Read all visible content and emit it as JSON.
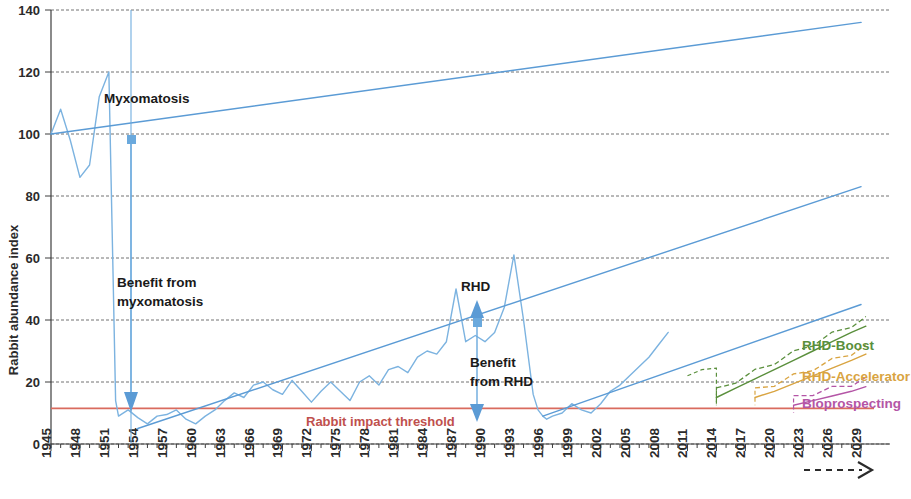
{
  "chart_data": {
    "type": "line",
    "title": "",
    "xlabel": "",
    "ylabel": "Rabbit abundance index",
    "ylim": [
      0,
      140
    ],
    "yticks": [
      0,
      20,
      40,
      60,
      80,
      100,
      120,
      140
    ],
    "xlim": [
      1945,
      2032
    ],
    "grid": true,
    "legend_position": "inline-right",
    "xticks": [
      "1945",
      "1948",
      "1951",
      "1954",
      "1957",
      "1960",
      "1963",
      "1966",
      "1969",
      "1972",
      "1975",
      "1978",
      "1981",
      "1984",
      "1987",
      "1990",
      "1993",
      "1996",
      "1999",
      "2002",
      "2005",
      "2008",
      "2011",
      "2014",
      "2017",
      "2020",
      "2023",
      "2026",
      "2029"
    ],
    "x_axis_continues_arrow": true,
    "annotations": [
      {
        "id": "myxomatosis",
        "text": "Myxomatosis",
        "x": 1954,
        "y": 110
      },
      {
        "id": "benefit-from-myxomatosis",
        "text": "Benefit from\nmyxomatosis",
        "line1": "Benefit from",
        "line2": "myxomatosis",
        "x": 1955,
        "y": 50
      },
      {
        "id": "rhd",
        "text": "RHD",
        "x": 1997,
        "y": 47
      },
      {
        "id": "benefit-from-rhd",
        "text": "Benefit\nfrom RHD",
        "line1": "Benefit",
        "line2": "from RHD",
        "x": 1999,
        "y": 27
      },
      {
        "id": "rabbit-impact-threshold",
        "text": "Rabbit impact threshold",
        "x": 1978,
        "y": 11
      }
    ],
    "threshold": {
      "label": "Rabbit impact threshold",
      "value": 11.5,
      "color": "#d96b5e"
    },
    "series": [
      {
        "name": "Rabbit abundance (observed)",
        "color": "#7cb3e0",
        "style": "solid",
        "x": [
          1945,
          1946,
          1947,
          1948,
          1949,
          1950,
          1951,
          1951.4,
          1951.7,
          1952,
          1953,
          1954,
          1955,
          1956,
          1957,
          1958,
          1959,
          1960,
          1961,
          1962,
          1963,
          1964,
          1965,
          1966,
          1967,
          1968,
          1969,
          1970,
          1971,
          1972,
          1973,
          1974,
          1975,
          1976,
          1977,
          1978,
          1979,
          1980,
          1981,
          1982,
          1983,
          1984,
          1985,
          1986,
          1987,
          1988,
          1989,
          1990,
          1991,
          1992,
          1993,
          1994,
          1995,
          1995.5,
          1996,
          1996.4,
          1997,
          1998,
          1999,
          2000,
          2001,
          2002,
          2003,
          2004,
          2005,
          2006,
          2007,
          2008,
          2009
        ],
        "y": [
          100,
          108,
          98,
          86,
          90,
          112,
          120,
          60,
          14,
          9,
          11,
          8.5,
          6.5,
          9,
          9.5,
          11,
          8,
          6.5,
          9,
          11,
          14,
          16.5,
          15,
          19,
          20,
          17.5,
          16,
          20.5,
          17,
          13.5,
          17,
          20,
          17,
          14,
          20,
          22,
          19,
          24,
          25,
          23,
          28,
          30,
          29,
          33,
          50,
          33,
          35,
          33,
          36,
          44,
          61,
          40,
          16,
          11,
          9,
          8,
          9,
          10,
          13,
          11,
          10,
          13,
          17,
          19,
          22,
          25,
          28,
          32,
          36
        ]
      },
      {
        "name": "Trend pre-myxomatosis (projected unmanaged)",
        "color": "#5b9bd5",
        "style": "solid",
        "x": [
          1945,
          2029
        ],
        "y": [
          100,
          136
        ]
      },
      {
        "name": "Trend post-myxomatosis (projected)",
        "color": "#5b9bd5",
        "style": "solid",
        "x": [
          1954,
          2029
        ],
        "y": [
          5,
          83
        ]
      },
      {
        "name": "Trend post-RHD (projected)",
        "color": "#5b9bd5",
        "style": "solid",
        "x": [
          1996,
          2029
        ],
        "y": [
          9,
          45
        ]
      },
      {
        "name": "RHD-Boost",
        "color": "#5a8f3c",
        "style": "solid-with-dashed-overlay",
        "x": [
          2014,
          2016,
          2018,
          2020,
          2022,
          2024,
          2026,
          2028,
          2029.5
        ],
        "y": [
          15,
          18,
          21,
          24,
          27,
          30,
          33,
          36,
          38
        ]
      },
      {
        "name": "RHD-Accelerator",
        "color": "#d9a441",
        "style": "solid-with-dashed-overlay",
        "x": [
          2018,
          2020,
          2022,
          2024,
          2026,
          2028,
          2029.5
        ],
        "y": [
          15,
          17,
          19.5,
          22,
          24.5,
          27,
          29
        ]
      },
      {
        "name": "Bioprospecting",
        "color": "#b455a6",
        "style": "solid-with-dashed-overlay",
        "x": [
          2022,
          2024,
          2026,
          2028,
          2029.5
        ],
        "y": [
          12.5,
          14,
          15.5,
          17,
          18.5
        ]
      }
    ],
    "scenario_labels": [
      {
        "name": "RHD-Boost",
        "color": "#5a8f3c"
      },
      {
        "name": "RHD-Accelerator",
        "color": "#d9a441"
      },
      {
        "name": "Bioprospecting",
        "color": "#b455a6"
      }
    ]
  },
  "axes": {
    "y_title": "Rabbit abundance index"
  }
}
